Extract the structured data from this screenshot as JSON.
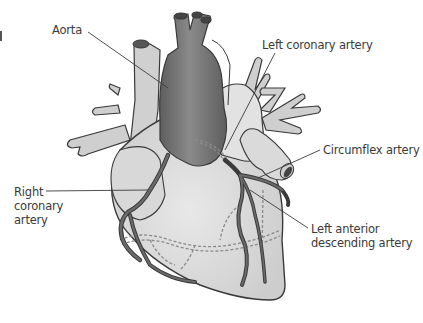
{
  "diagram": {
    "labels": {
      "aorta": "Aorta",
      "left_coronary_artery": "Left coronary artery",
      "circumflex_artery": "Circumflex artery",
      "right_coronary_artery": "Right coronary artery",
      "left_anterior_descending_artery": "Left anterior descending artery"
    },
    "colors": {
      "background": "#ffffff",
      "heart_body": "#d4d4d4",
      "heart_highlight": "#e6e6e6",
      "aorta": "#6e6e6e",
      "arteries": "#555555",
      "outline": "#3a3a3a",
      "vessels_light": "#c8c8c8",
      "dashed_vessels": "#8a8a8a",
      "label_text": "#3a3a3a"
    }
  }
}
